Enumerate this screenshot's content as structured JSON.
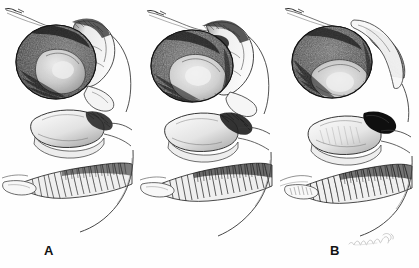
{
  "figure": {
    "kind": "anatomical-line-drawing",
    "medium": "pen-and-ink stipple and hatching",
    "background_color": "#fefefe",
    "ink_color": "#1a1a1a",
    "panel_count": 3,
    "width_px": 419,
    "height_px": 268
  },
  "panels": [
    {
      "id": "A",
      "label": "A",
      "label_position": {
        "x": 44,
        "y": 244
      },
      "description": "Sagittal anatomical drawing, stage A: rounded densely stippled mass upper left with nested lighter lobe, adjoining pale wedge-shaped structure at right, a thin curved filament trailing to upper left, a smooth ovoid body in the middle third, a heavily hatched elongated band below it, and a long sweeping contour descending to lower right."
    },
    {
      "id": "B",
      "label": "B",
      "label_position": {
        "x": 190,
        "y": 244
      },
      "description": "Sagittal anatomical drawing, stage B: the rounded stippled mass is rotated and the pale wedge now overlaps it from the right; nested lobe is larger and paler; the ovoid body below is tipped with a dark hatched cap at its right end; the hatched band beneath is broader and denser."
    },
    {
      "id": "C",
      "label": "C",
      "label_position": {
        "x": 336,
        "y": 244
      },
      "description": "Sagittal anatomical drawing, stage C: the rounded stippled mass is fully reoriented with a broad pale lobe sweeping across its lower right; an elongated stippled strip runs along the upper right margin; the ovoid body below carries a solid black block at its right end; the hatched band beneath is combed into long parallel strokes."
    }
  ],
  "annotations": {
    "artist_signature": {
      "name": "artist-signature",
      "text": "",
      "legible": false,
      "note": "faint cursive signature in light graphite at lower right of panel C",
      "position": {
        "x": 347,
        "y": 231
      }
    }
  },
  "colors": {
    "paper": "#fefefe",
    "ink_dark": "#1a1a1a",
    "ink_mid": "#4a4a4a",
    "ink_light": "#8c8c8c",
    "ink_faint": "#c8c8c8",
    "signature": "#b9b9b9",
    "label_text": "#121212"
  }
}
